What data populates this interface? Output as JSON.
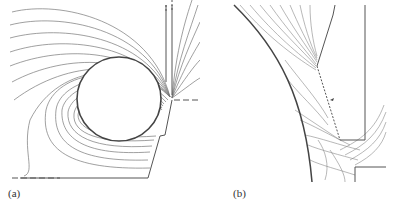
{
  "figure": {
    "panels": [
      {
        "id": "a",
        "label": "(a)",
        "description": "Equipotential / field lines around a circular conductor next to a vertical slot electrode"
      },
      {
        "id": "b",
        "label": "(b)",
        "description": "Close-up of field lines in curved gap near slot corner with dashed boundary"
      }
    ]
  },
  "colors": {
    "lines": "#666666",
    "boundary": "#444444",
    "background": "#ffffff"
  }
}
